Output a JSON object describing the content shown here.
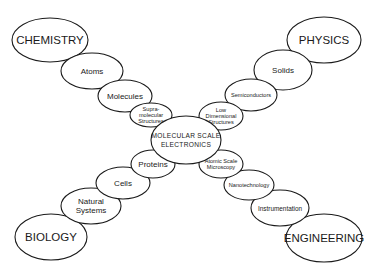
{
  "diagram": {
    "center": {
      "id": "center",
      "lines": [
        "MOLECULAR SCALE",
        "ELECTRONICS"
      ],
      "cx": 186,
      "cy": 140,
      "rx": 35,
      "ry": 24,
      "size": "c"
    },
    "branches": [
      {
        "name": "chemistry",
        "nodes": [
          {
            "id": "supramolecular",
            "lines": [
              "Supra-",
              "molecular",
              "Structures"
            ],
            "cx": 151,
            "cy": 115,
            "rx": 21,
            "ry": 12,
            "size": "s"
          },
          {
            "id": "molecules",
            "lines": [
              "Molecules"
            ],
            "cx": 125,
            "cy": 96,
            "rx": 27,
            "ry": 16,
            "size": "l"
          },
          {
            "id": "atoms",
            "lines": [
              "Atoms"
            ],
            "cx": 92,
            "cy": 71,
            "rx": 31,
            "ry": 18,
            "size": "l"
          },
          {
            "id": "chemistry",
            "lines": [
              "CHEMISTRY"
            ],
            "cx": 50,
            "cy": 40,
            "rx": 38,
            "ry": 22,
            "size": "xl"
          }
        ]
      },
      {
        "name": "physics",
        "nodes": [
          {
            "id": "low-dimensional",
            "lines": [
              "Low",
              "Dimensional",
              "Structures"
            ],
            "cx": 221,
            "cy": 116,
            "rx": 22,
            "ry": 14,
            "size": "s"
          },
          {
            "id": "semiconductors",
            "lines": [
              "Semiconductors"
            ],
            "cx": 251,
            "cy": 95,
            "rx": 26,
            "ry": 16,
            "size": "s"
          },
          {
            "id": "solids",
            "lines": [
              "Solids"
            ],
            "cx": 283,
            "cy": 70,
            "rx": 29,
            "ry": 20,
            "size": "l"
          },
          {
            "id": "physics",
            "lines": [
              "PHYSICS"
            ],
            "cx": 324,
            "cy": 40,
            "rx": 37,
            "ry": 23,
            "size": "xl"
          }
        ]
      },
      {
        "name": "biology",
        "nodes": [
          {
            "id": "proteins",
            "lines": [
              "Proteins"
            ],
            "cx": 153,
            "cy": 164,
            "rx": 22,
            "ry": 14,
            "size": "l"
          },
          {
            "id": "cells",
            "lines": [
              "Cells"
            ],
            "cx": 123,
            "cy": 183,
            "rx": 27,
            "ry": 16,
            "size": "l"
          },
          {
            "id": "natural-systems",
            "lines": [
              "Natural",
              "Systems"
            ],
            "cx": 91,
            "cy": 206,
            "rx": 30,
            "ry": 18,
            "size": "l"
          },
          {
            "id": "biology",
            "lines": [
              "BIOLOGY"
            ],
            "cx": 51,
            "cy": 237,
            "rx": 36,
            "ry": 23,
            "size": "xl"
          }
        ]
      },
      {
        "name": "engineering",
        "nodes": [
          {
            "id": "atomic-scale-microscopy",
            "lines": [
              "Atomic Scale",
              "Microscopy"
            ],
            "cx": 221,
            "cy": 164,
            "rx": 22,
            "ry": 14,
            "size": "s"
          },
          {
            "id": "nanotechnology",
            "lines": [
              "Nanotechnology"
            ],
            "cx": 249,
            "cy": 185,
            "rx": 25,
            "ry": 15,
            "size": "s"
          },
          {
            "id": "instrumentation",
            "lines": [
              "Instrumentation"
            ],
            "cx": 280,
            "cy": 208,
            "rx": 29,
            "ry": 18,
            "size": "m"
          },
          {
            "id": "engineering",
            "lines": [
              "ENGINEERING"
            ],
            "cx": 324,
            "cy": 238,
            "rx": 38,
            "ry": 24,
            "size": "xl"
          }
        ]
      }
    ],
    "connectors": [
      {
        "from": "center",
        "to": "supramolecular"
      },
      {
        "from": "center",
        "to": "low-dimensional"
      },
      {
        "from": "center",
        "to": "proteins"
      },
      {
        "from": "center",
        "to": "atomic-scale-microscopy"
      }
    ]
  }
}
